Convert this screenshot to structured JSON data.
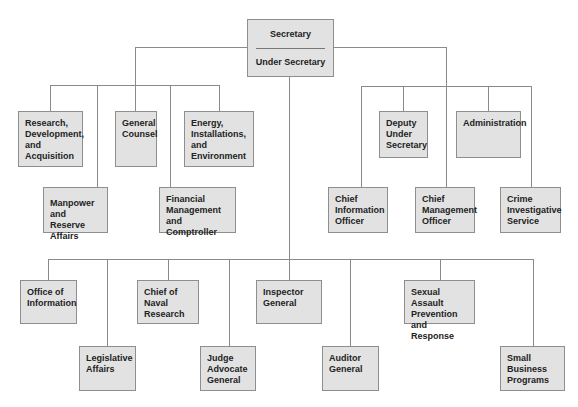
{
  "chart": {
    "root": {
      "title": "Secretary",
      "subtitle": "Under Secretary"
    },
    "left_branch": [
      {
        "label": "Research,\nDevelopment,\nand\nAcquisition"
      },
      {
        "label": "General\nCounsel"
      },
      {
        "label": "Energy,\nInstallations,\nand\nEnvironment"
      },
      {
        "label": "Manpower and\nReserve Affairs"
      },
      {
        "label": "Financial\nManagement and\nComptroller"
      }
    ],
    "right_branch": [
      {
        "label": "Deputy\nUnder\nSecretary"
      },
      {
        "label": "Administration"
      },
      {
        "label": "Chief\nInformation\nOfficer"
      },
      {
        "label": "Chief\nManagement\nOfficer"
      },
      {
        "label": "Crime\nInvestigative\nService"
      }
    ],
    "bottom_branch": [
      {
        "label": "Office of\nInformation"
      },
      {
        "label": "Legislative\nAffairs"
      },
      {
        "label": "Chief of Naval\nResearch"
      },
      {
        "label": "Judge\nAdvocate\nGeneral"
      },
      {
        "label": "Inspector\nGeneral"
      },
      {
        "label": "Auditor\nGeneral"
      },
      {
        "label": "Sexual Assault\nPrevention and\nResponse"
      },
      {
        "label": "Small Business\nPrograms"
      }
    ]
  },
  "colors": {
    "box_fill": "#e2e2e2",
    "box_border": "#8e8e8e",
    "connector": "#8a8a8a"
  }
}
